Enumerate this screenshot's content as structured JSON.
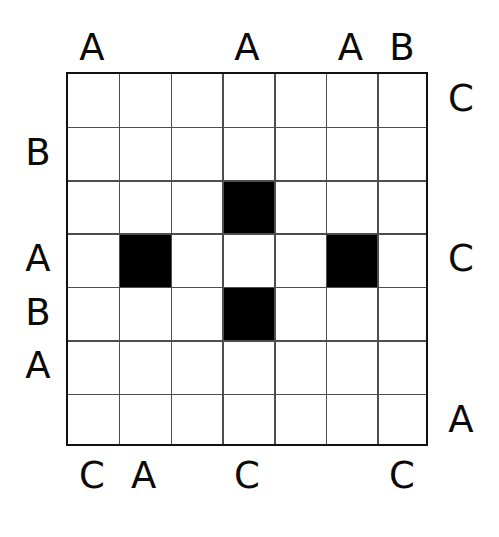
{
  "puzzle": {
    "title": "Grid Pattern Puzzle",
    "grid": {
      "rows": 7,
      "cols": 7,
      "cell_width": 51.7,
      "cell_height": 53.4,
      "origin_x": 66,
      "origin_y": 72,
      "border_color": "#111111",
      "gridline_color": "#4d4d4d",
      "background_color": "#ffffff",
      "filled_color": "#000000"
    },
    "filled_cells": [
      {
        "row": 3,
        "col": 4
      },
      {
        "row": 4,
        "col": 2
      },
      {
        "row": 4,
        "col": 6
      },
      {
        "row": 5,
        "col": 4
      }
    ],
    "labels": {
      "top": [
        "A",
        "",
        "",
        "A",
        "",
        "A",
        "B"
      ],
      "bottom": [
        "C",
        "A",
        "",
        "C",
        "",
        "",
        "C"
      ],
      "left": [
        "",
        "B",
        "",
        "A",
        "B",
        "A",
        ""
      ],
      "right": [
        "C",
        "",
        "",
        "C",
        "",
        "",
        "A"
      ]
    }
  }
}
